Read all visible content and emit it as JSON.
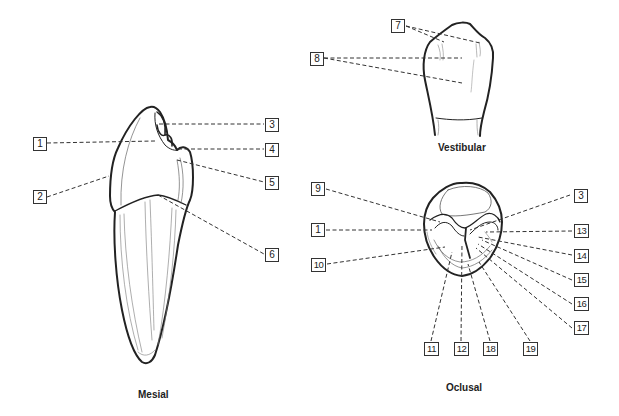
{
  "diagram": {
    "views": [
      {
        "id": "mesial",
        "caption": "Mesial",
        "labels": [
          "1",
          "2",
          "3",
          "4",
          "5",
          "6"
        ]
      },
      {
        "id": "vestibular",
        "caption": "Vestibular",
        "labels": [
          "7",
          "8"
        ]
      },
      {
        "id": "oclusal",
        "caption": "Oclusal",
        "labels": [
          "9",
          "1",
          "10",
          "3",
          "13",
          "14",
          "15",
          "16",
          "17",
          "11",
          "12",
          "18",
          "19"
        ]
      }
    ]
  },
  "captions": {
    "mesial": "Mesial",
    "vestibular": "Vestibular",
    "oclusal": "Oclusal"
  },
  "labels": {
    "mesial": {
      "l1": "1",
      "l2": "2",
      "l3": "3",
      "l4": "4",
      "l5": "5",
      "l6": "6"
    },
    "vestibular": {
      "l7": "7",
      "l8": "8"
    },
    "oclusal": {
      "l9": "9",
      "l1": "1",
      "l10": "10",
      "l3": "3",
      "l13": "13",
      "l14": "14",
      "l15": "15",
      "l16": "16",
      "l17": "17",
      "l11": "11",
      "l12": "12",
      "l18": "18",
      "l19": "19"
    }
  },
  "colors": {
    "line": "#222222",
    "leader": "#333333",
    "background": "#ffffff"
  }
}
